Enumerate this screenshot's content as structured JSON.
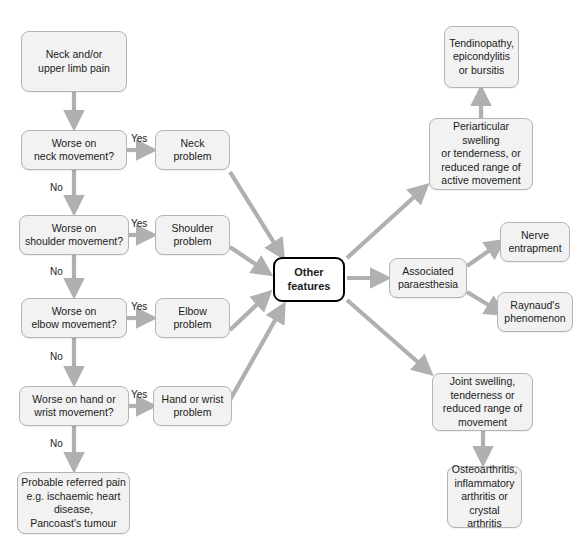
{
  "diagram": {
    "colors": {
      "node_fill": "#f2f2f2",
      "node_border": "#b4b4b4",
      "emphasis_border": "#000000",
      "arrow": "#b0b0b0",
      "text": "#1b1b1b",
      "background": "#ffffff"
    },
    "nodes": {
      "start": "Neck and/or\nupper limb pain",
      "q_neck": "Worse on\nneck movement?",
      "q_shoulder": "Worse on\nshoulder movement?",
      "q_elbow": "Worse on\nelbow movement?",
      "q_hand": "Worse on hand or\nwrist movement?",
      "referred_pain": "Probable referred pain\ne.g. ischaemic heart\ndisease,\nPancoast's tumour",
      "neck_problem": "Neck\nproblem",
      "shoulder_problem": "Shoulder\nproblem",
      "elbow_problem": "Elbow\nproblem",
      "hand_problem": "Hand or wrist\nproblem",
      "other_features": "Other\nfeatures",
      "periarticular": "Periarticular swelling\nor tenderness, or\nreduced range of\nactive movement",
      "tendinopathy": "Tendinopathy,\nepicondylitis\nor bursitis",
      "paraesthesia": "Associated\nparaesthesia",
      "nerve_entrapment": "Nerve\nentrapment",
      "raynauds": "Raynaud's\nphenomenon",
      "joint_swelling": "Joint swelling,\ntenderness or\nreduced range of\nmovement",
      "osteoarthritis": "Osteoarthritis,\ninflammatory\narthritis or\ncrystal arthritis"
    },
    "edge_labels": {
      "yes_neck": "Yes",
      "no_neck": "No",
      "yes_shoulder": "Yes",
      "no_shoulder": "No",
      "yes_elbow": "Yes",
      "no_elbow": "No",
      "yes_hand": "Yes",
      "no_hand": "No"
    }
  }
}
